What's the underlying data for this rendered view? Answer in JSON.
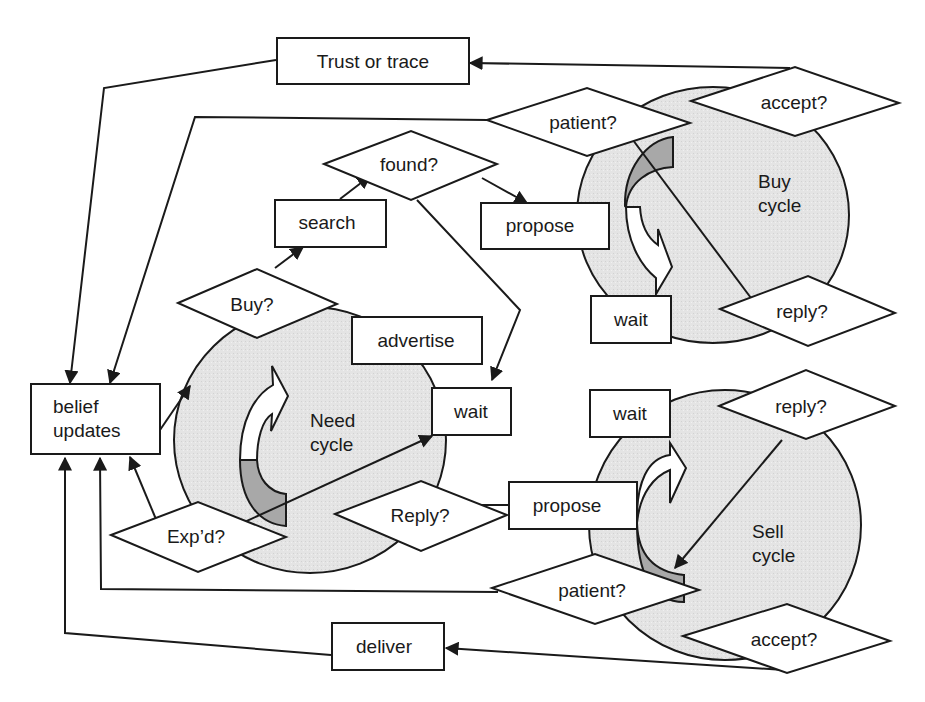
{
  "diagram": {
    "cycles": {
      "need": {
        "line1": "Need",
        "line2": "cycle"
      },
      "buy": {
        "line1": "Buy",
        "line2": "cycle"
      },
      "sell": {
        "line1": "Sell",
        "line2": "cycle"
      }
    },
    "boxes": {
      "trust_or_trace": "Trust or trace",
      "search": "search",
      "propose_buy": "propose",
      "advertise": "advertise",
      "wait_need": "wait",
      "wait_buy": "wait",
      "wait_sell": "wait",
      "propose_sell": "propose",
      "deliver": "deliver",
      "belief_updates": {
        "line1": "belief",
        "line2": "updates"
      }
    },
    "decisions": {
      "found": "found?",
      "buy": "Buy?",
      "patient_buy": "patient?",
      "accept_buy": "accept?",
      "reply_buy": "reply?",
      "reply_sell": "reply?",
      "exp_d": "Exp’d?",
      "reply_need": "Reply?",
      "patient_sell": "patient?",
      "accept_sell": "accept?"
    }
  }
}
